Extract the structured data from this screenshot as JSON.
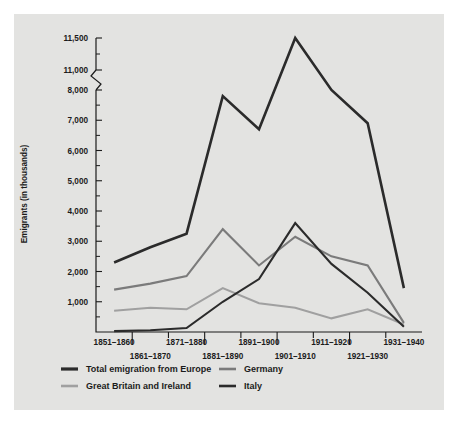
{
  "figure": {
    "background_color": "#e3e3e1",
    "page_background_color": "#ffffff",
    "axis_color": "#1b1b1b"
  },
  "chart_data": {
    "type": "line",
    "title": "",
    "xlabel": "",
    "ylabel": "Emigrants (in thousands)",
    "grid": false,
    "legend_position": "bottom",
    "axis_break": {
      "present": true,
      "between": [
        8000,
        11000
      ],
      "note": "y-axis broken between 8,000 and 11,000"
    },
    "ylim": [
      0,
      11500
    ],
    "ytick_labels": [
      "1,000",
      "2,000",
      "3,000",
      "4,000",
      "5,000",
      "6,000",
      "7,000",
      "8,000",
      "11,000",
      "11,500"
    ],
    "ytick_values": [
      1000,
      2000,
      3000,
      4000,
      5000,
      6000,
      7000,
      8000,
      11000,
      11500
    ],
    "yminor_values": [
      500,
      1500,
      2500,
      3500,
      4500,
      5500,
      6500,
      7500,
      11250
    ],
    "categories": [
      "1851–1860",
      "1861–1870",
      "1871–1880",
      "1881–1890",
      "1891–1900",
      "1901–1910",
      "1911–1920",
      "1921–1930",
      "1931–1940"
    ],
    "categories_row_top": [
      "1851–1860",
      "1871–1880",
      "1891–1900",
      "1911–1920",
      "1931–1940"
    ],
    "categories_row_bottom": [
      "1861–1870",
      "1881–1890",
      "1901–1910",
      "1921–1930"
    ],
    "series": [
      {
        "name": "Total emigration from Europe",
        "color": "#2b2b2b",
        "width": 2.6,
        "values": [
          2300,
          2800,
          3250,
          7800,
          6700,
          11500,
          8000,
          6900,
          1450
        ]
      },
      {
        "name": "Germany",
        "color": "#7b7b7b",
        "width": 2.1,
        "values": [
          1400,
          1600,
          1850,
          3400,
          2200,
          3150,
          2500,
          2200,
          300
        ]
      },
      {
        "name": "Great Britain and Ireland",
        "color": "#a0a0a0",
        "width": 2.1,
        "values": [
          700,
          800,
          750,
          1450,
          950,
          800,
          450,
          750,
          250
        ]
      },
      {
        "name": "Italy",
        "color": "#2b2b2b",
        "width": 2.1,
        "values": [
          30,
          60,
          130,
          1000,
          1750,
          3600,
          2250,
          1300,
          170
        ]
      }
    ]
  },
  "legend": {
    "entries": [
      {
        "label": "Total emigration from Europe",
        "color": "#2b2b2b",
        "width": 3.2
      },
      {
        "label": "Germany",
        "color": "#7b7b7b",
        "width": 2.6
      },
      {
        "label": "Great Britain and Ireland",
        "color": "#a0a0a0",
        "width": 2.6
      },
      {
        "label": "Italy",
        "color": "#2b2b2b",
        "width": 2.6
      }
    ]
  }
}
